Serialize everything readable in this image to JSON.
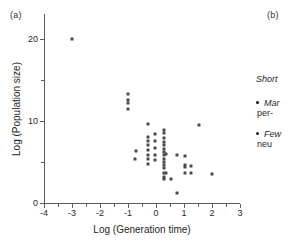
{
  "figure": {
    "panel_a_label": "(a)",
    "panel_b_label": "(b)"
  },
  "legend": {
    "heading": "Short",
    "items": [
      {
        "bullet": "bullet-icon",
        "line1": "Mar",
        "line2": "per-"
      },
      {
        "bullet": "bullet-icon",
        "line1": "Few",
        "line2": "neu"
      }
    ]
  },
  "chart_data": {
    "type": "scatter",
    "title": "",
    "xlabel": "Log (Generation time)",
    "ylabel": "Log (Population size)",
    "xlim": [
      -4,
      3
    ],
    "ylim": [
      0,
      23
    ],
    "xticks": [
      -4,
      -3,
      -2,
      -1,
      0,
      1,
      2,
      3
    ],
    "xtick_labels": [
      "-4",
      "-3",
      "-2",
      "-1",
      "0",
      "1",
      "2",
      "3"
    ],
    "xminor_ticks": [
      -3.5,
      -2.5,
      -1.5,
      -0.5,
      0.5,
      1.5,
      2.5
    ],
    "yticks": [
      0,
      10,
      20
    ],
    "ytick_labels": [
      "0",
      "10",
      "20"
    ],
    "yminor_ticks": [
      5,
      15
    ],
    "grid": false,
    "legend_position": "right",
    "marker_color": "#4a4a4a",
    "series": [
      {
        "name": "populations",
        "points": [
          [
            -3.0,
            19.9
          ],
          [
            -1.0,
            13.3
          ],
          [
            -1.0,
            12.5
          ],
          [
            -1.0,
            12.2
          ],
          [
            -1.0,
            11.5
          ],
          [
            -0.72,
            6.3
          ],
          [
            -0.75,
            5.4
          ],
          [
            -0.3,
            9.6
          ],
          [
            -0.3,
            8.0
          ],
          [
            -0.3,
            7.5
          ],
          [
            -0.3,
            7.0
          ],
          [
            -0.3,
            6.4
          ],
          [
            -0.3,
            5.9
          ],
          [
            -0.3,
            5.4
          ],
          [
            -0.3,
            4.7
          ],
          [
            -0.05,
            8.4
          ],
          [
            -0.05,
            7.6
          ],
          [
            -0.05,
            6.7
          ],
          [
            -0.05,
            5.9
          ],
          [
            -0.05,
            5.2
          ],
          [
            0.3,
            8.9
          ],
          [
            0.3,
            8.5
          ],
          [
            0.3,
            7.9
          ],
          [
            0.3,
            7.4
          ],
          [
            0.3,
            7.0
          ],
          [
            0.3,
            6.6
          ],
          [
            0.3,
            6.2
          ],
          [
            0.3,
            5.8
          ],
          [
            0.3,
            5.4
          ],
          [
            0.3,
            5.0
          ],
          [
            0.3,
            4.6
          ],
          [
            0.3,
            4.2
          ],
          [
            0.3,
            3.7
          ],
          [
            0.3,
            3.2
          ],
          [
            0.3,
            2.9
          ],
          [
            0.35,
            6.0
          ],
          [
            0.35,
            3.6
          ],
          [
            0.55,
            2.9
          ],
          [
            0.75,
            5.9
          ],
          [
            0.75,
            1.2
          ],
          [
            1.05,
            5.7
          ],
          [
            1.05,
            4.6
          ],
          [
            1.05,
            4.4
          ],
          [
            1.05,
            3.6
          ],
          [
            1.25,
            4.5
          ],
          [
            1.25,
            3.6
          ],
          [
            1.55,
            9.5
          ],
          [
            2.0,
            3.5
          ]
        ]
      }
    ]
  }
}
